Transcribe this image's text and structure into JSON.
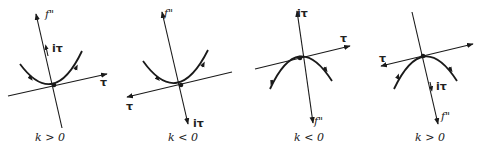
{
  "figure": {
    "panels": [
      {
        "id": "panel-1",
        "caption": "k > 0",
        "labels": {
          "f": "f\"",
          "itau": "iτ",
          "tau": "τ"
        },
        "curve": "upward parabola"
      },
      {
        "id": "panel-2",
        "caption": "k < 0",
        "labels": {
          "f": "f\"",
          "itau": "iτ",
          "tau": "τ"
        },
        "curve": "upward parabola"
      },
      {
        "id": "panel-3",
        "caption": "k < 0",
        "labels": {
          "f": "f\"",
          "itau": "iτ",
          "tau": "τ"
        },
        "curve": "downward parabola"
      },
      {
        "id": "panel-4",
        "caption": "k > 0",
        "labels": {
          "f": "f\"",
          "itau": "iτ",
          "tau": "τ"
        },
        "curve": "downward parabola"
      }
    ],
    "colors": {
      "ink": "#1a1a1a",
      "background": "#ffffff"
    }
  }
}
